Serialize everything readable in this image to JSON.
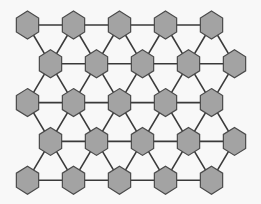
{
  "diagram": {
    "type": "triangular-lattice-graph",
    "node_shape": "hexagon",
    "colors": {
      "background": "#f8f8f8",
      "node_fill": "#a3a3a3",
      "node_stroke": "#4a4a4a",
      "edge": "#3a3a3a"
    },
    "rows": [
      {
        "id": "row-1",
        "nodes": 5,
        "offset": false
      },
      {
        "id": "row-2",
        "nodes": 5,
        "offset": true
      },
      {
        "id": "row-3",
        "nodes": 5,
        "offset": false
      },
      {
        "id": "row-4",
        "nodes": 5,
        "offset": true
      },
      {
        "id": "row-5",
        "nodes": 5,
        "offset": false
      }
    ],
    "node_count": 25,
    "connectivity": "each node links to horizontal neighbors in its row and to the two nearest nodes in adjacent rows"
  }
}
